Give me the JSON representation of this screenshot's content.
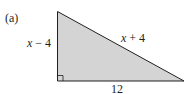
{
  "figure": {
    "part_label": "(a)",
    "shape": "right-triangle",
    "fill_color": "#d4d4d4",
    "stroke_color": "#231f20",
    "sides": {
      "vertical_leg": {
        "var": "x",
        "rest": " − 4"
      },
      "hypotenuse": {
        "var": "x",
        "rest": " + 4"
      },
      "horizontal_leg": "12"
    },
    "right_angle_marker": true
  }
}
